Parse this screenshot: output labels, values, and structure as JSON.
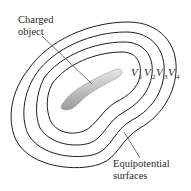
{
  "diagram": {
    "labels": {
      "charged_object_line1": "Charged",
      "charged_object_line2": "object",
      "equipotential_line1": "Equipotential",
      "equipotential_line2": "surfaces"
    },
    "potentials": [
      {
        "symbol": "V",
        "sub": "1"
      },
      {
        "symbol": "V",
        "sub": "2"
      },
      {
        "symbol": "V",
        "sub": "3"
      },
      {
        "symbol": "V",
        "sub": "4"
      }
    ],
    "colors": {
      "contour": "#1e1e1e",
      "object_fill_light": "#e2e2e2",
      "object_fill_dark": "#9a9a9a",
      "text": "#2a2a2a"
    }
  }
}
